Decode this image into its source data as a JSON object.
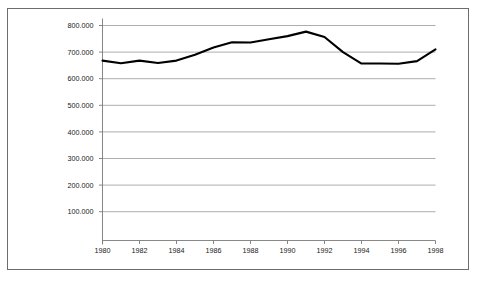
{
  "chart_data": {
    "type": "line",
    "title": "",
    "subtitle": "",
    "xlabel": "",
    "ylabel": "",
    "xlim": [
      1980,
      1998
    ],
    "ylim": [
      0,
      800000
    ],
    "grid": true,
    "legend": null,
    "legend_position": "none",
    "x_tick_labels": [
      "1980",
      "1982",
      "1984",
      "1986",
      "1988",
      "1990",
      "1992",
      "1994",
      "1996",
      "1998"
    ],
    "x_tick_values": [
      1980,
      1982,
      1984,
      1986,
      1988,
      1990,
      1992,
      1994,
      1996,
      1998
    ],
    "y_tick_labels": [
      "800.000",
      "700.000",
      "600.000",
      "500.000",
      "400.000",
      "300.000",
      "200.000",
      "100.000"
    ],
    "y_tick_values": [
      800000,
      700000,
      600000,
      500000,
      400000,
      300000,
      200000,
      100000
    ],
    "x": [
      1980,
      1981,
      1982,
      1983,
      1984,
      1985,
      1986,
      1987,
      1988,
      1989,
      1990,
      1991,
      1992,
      1993,
      1994,
      1995,
      1996,
      1997,
      1998
    ],
    "values": [
      668000,
      658000,
      668000,
      659000,
      668000,
      690000,
      717000,
      737000,
      736000,
      748000,
      760000,
      777000,
      757000,
      700000,
      657000,
      657000,
      656000,
      666000,
      710000
    ],
    "series": [
      {
        "name": "series-1",
        "color": "#000000",
        "values": [
          668000,
          658000,
          668000,
          659000,
          668000,
          690000,
          717000,
          737000,
          736000,
          748000,
          760000,
          777000,
          757000,
          700000,
          657000,
          657000,
          656000,
          666000,
          710000
        ]
      }
    ],
    "colors": {
      "series_line": "#000000",
      "gridline": "#8a8a8a",
      "axis": "#7a7a7a",
      "frame_border": "#6d6d6d",
      "background": "#ffffff",
      "text": "#1a1a1a"
    }
  }
}
